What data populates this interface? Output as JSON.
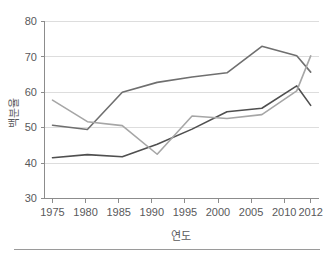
{
  "figure": {
    "background_color": "#ffffff",
    "footer_rule_color": "#9a9a9a"
  },
  "chart_data": {
    "type": "line",
    "title": "",
    "xlabel": "연도",
    "ylabel": "백분율",
    "categories": [
      "1975",
      "1980",
      "1985",
      "1990",
      "1995",
      "2000",
      "2005",
      "2010",
      "2012"
    ],
    "x": [
      1975,
      1980,
      1985,
      1990,
      1995,
      2000,
      2005,
      2010,
      2012
    ],
    "xlim": [
      1975,
      2012
    ],
    "ylim": [
      30,
      80
    ],
    "yticks": [
      30,
      40,
      50,
      60,
      70,
      80
    ],
    "ytick_labels": [
      "30",
      "40",
      "50",
      "60",
      "70",
      "80"
    ],
    "grid": "horizontal",
    "legend": "none",
    "series": [
      {
        "name": "series-upper",
        "color": "#6f6f6f",
        "values": [
          50.7,
          49.5,
          60.0,
          62.8,
          64.3,
          65.5,
          73.0,
          70.3,
          65.7
        ]
      },
      {
        "name": "series-lower",
        "color": "#4f4f4f",
        "values": [
          41.5,
          42.4,
          41.8,
          45.3,
          49.6,
          54.5,
          55.5,
          61.8,
          56.3
        ]
      },
      {
        "name": "series-light",
        "color": "#a6a6a6",
        "values": [
          57.8,
          51.7,
          50.6,
          42.5,
          53.3,
          52.6,
          53.7,
          60.4,
          70.3
        ]
      }
    ]
  },
  "axis": {
    "y_title": "백분율",
    "x_title": "연도",
    "tick_color": "#8c8c8c",
    "grid_color": "#dddddd",
    "label_color": "#59595b"
  }
}
